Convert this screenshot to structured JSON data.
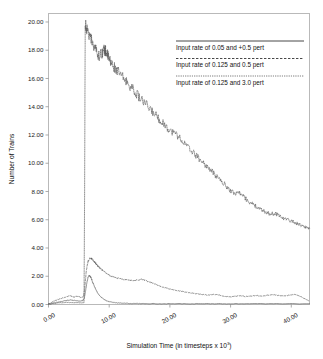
{
  "chart_data": {
    "type": "line",
    "title": "",
    "xlabel": "Simulation Time (in timesteps x 10",
    "xlabel_sup": "3",
    "xlabel_tail": ")",
    "ylabel": "Number of Trains",
    "xlim": [
      0,
      43
    ],
    "ylim": [
      0,
      20.6
    ],
    "grid": false,
    "legend_position": "upper-right",
    "xticks": [
      "0.00",
      "10.00",
      "20.00",
      "30.00",
      "40.00"
    ],
    "xtick_values": [
      0,
      10,
      20,
      30,
      40
    ],
    "yticks": [
      "0.00",
      "2.00",
      "4.00",
      "6.00",
      "8.00",
      "10.00",
      "12.00",
      "14.00",
      "16.00",
      "18.00",
      "20.00"
    ],
    "ytick_values": [
      0,
      2,
      4,
      6,
      8,
      10,
      12,
      14,
      16,
      18,
      20
    ],
    "series": [
      {
        "name": "Input rate of 0.05 and +0.5 pert",
        "style": "solid",
        "color": "#555555",
        "x": [
          0.0,
          0.7,
          1.4,
          2.1,
          2.8,
          3.2,
          3.6,
          4.0,
          4.4,
          4.8,
          5.2,
          5.6,
          5.9,
          6.1,
          6.3,
          6.5,
          6.7,
          6.9,
          7.1,
          7.3,
          7.6,
          7.9,
          8.2,
          8.6,
          9.0,
          9.5,
          10.0,
          10.6,
          11.2,
          12.0,
          13.0,
          14.0,
          15.0,
          17.0,
          19.0,
          21.0,
          24.0,
          27.0,
          30.0,
          34.0,
          38.0,
          43.0
        ],
        "y": [
          0.02,
          0.1,
          0.16,
          0.22,
          0.28,
          0.3,
          0.33,
          0.3,
          0.28,
          0.26,
          0.24,
          0.26,
          0.45,
          0.95,
          1.5,
          1.9,
          2.05,
          1.98,
          1.8,
          1.55,
          1.25,
          0.98,
          0.75,
          0.55,
          0.4,
          0.28,
          0.2,
          0.15,
          0.12,
          0.1,
          0.08,
          0.07,
          0.06,
          0.06,
          0.05,
          0.05,
          0.05,
          0.05,
          0.05,
          0.05,
          0.05,
          0.05
        ]
      },
      {
        "name": "Input rate of 0.125 and 0.5 pert",
        "style": "dashed",
        "color": "#555555",
        "x": [
          0.0,
          0.6,
          1.2,
          1.8,
          2.4,
          3.0,
          3.4,
          3.8,
          4.2,
          4.6,
          5.0,
          5.4,
          5.8,
          6.0,
          6.2,
          6.5,
          6.8,
          7.1,
          7.4,
          7.7,
          8.0,
          8.4,
          8.8,
          9.3,
          9.8,
          10.3,
          10.9,
          11.5,
          12.1,
          12.7,
          13.3,
          14.0,
          14.7,
          15.3,
          15.9,
          16.5,
          17.2,
          17.9,
          18.6,
          19.4,
          20.2,
          21.0,
          21.8,
          22.6,
          23.5,
          24.4,
          25.3,
          26.2,
          27.1,
          28.0,
          28.9,
          29.8,
          30.7,
          31.6,
          32.5,
          33.4,
          34.3,
          35.2,
          36.1,
          37.0,
          37.9,
          38.8,
          39.7,
          40.5,
          41.2,
          41.8,
          42.4,
          43.0
        ],
        "y": [
          0.03,
          0.18,
          0.3,
          0.38,
          0.48,
          0.55,
          0.62,
          0.58,
          0.52,
          0.6,
          0.55,
          0.5,
          0.58,
          1.3,
          2.3,
          3.05,
          3.3,
          3.25,
          3.1,
          2.95,
          2.8,
          2.62,
          2.45,
          2.3,
          2.15,
          2.02,
          1.92,
          1.86,
          1.8,
          1.76,
          1.72,
          1.7,
          1.74,
          1.78,
          1.72,
          1.62,
          1.5,
          1.38,
          1.26,
          1.16,
          1.08,
          1.0,
          0.94,
          0.88,
          0.82,
          0.76,
          0.72,
          0.66,
          0.72,
          0.68,
          0.58,
          0.54,
          0.58,
          0.62,
          0.56,
          0.6,
          0.64,
          0.58,
          0.66,
          0.7,
          0.64,
          0.6,
          0.66,
          0.72,
          0.62,
          0.5,
          0.36,
          0.24
        ]
      },
      {
        "name": "Input rate of 0.125 and 3.0 pert",
        "style": "dotted",
        "color": "#555555",
        "x": [
          0.0,
          1.0,
          2.0,
          3.0,
          4.0,
          5.0,
          5.6,
          5.85,
          5.95,
          6.05,
          6.3,
          6.8,
          7.3,
          7.8,
          8.3,
          8.8,
          9.1,
          9.4,
          9.7,
          10.0,
          10.4,
          11.0,
          11.6,
          12.3,
          13.0,
          13.8,
          14.6,
          15.4,
          16.2,
          17.0,
          17.8,
          18.6,
          19.4,
          20.2,
          21.0,
          21.8,
          22.6,
          23.4,
          24.2,
          25.0,
          25.8,
          26.6,
          27.4,
          28.2,
          29.0,
          29.8,
          30.6,
          31.4,
          32.0,
          32.6,
          33.4,
          34.2,
          35.0,
          35.8,
          36.6,
          37.4,
          38.2,
          39.0,
          39.8,
          40.6,
          41.4,
          42.2,
          43.0
        ],
        "y": [
          0.02,
          0.08,
          0.12,
          0.15,
          0.14,
          0.13,
          0.12,
          0.12,
          8.0,
          19.8,
          19.55,
          19.0,
          18.5,
          18.05,
          17.6,
          17.8,
          18.05,
          17.95,
          17.7,
          17.35,
          17.05,
          16.7,
          16.4,
          16.05,
          15.7,
          15.3,
          14.85,
          14.45,
          14.1,
          13.7,
          13.35,
          12.95,
          12.6,
          12.25,
          12.1,
          11.7,
          11.3,
          10.95,
          10.6,
          10.25,
          9.9,
          9.55,
          9.2,
          8.85,
          8.5,
          8.15,
          7.85,
          7.95,
          7.7,
          7.45,
          7.15,
          6.95,
          6.7,
          6.55,
          6.4,
          6.45,
          6.25,
          6.05,
          5.95,
          5.8,
          5.65,
          5.5,
          5.4
        ]
      }
    ],
    "legend": [
      {
        "label": "Input rate of 0.05 and +0.5 pert",
        "style": "solid"
      },
      {
        "label": "Input rate of 0.125 and 0.5 pert",
        "style": "dashed"
      },
      {
        "label": "Input rate of 0.125 and 3.0 pert",
        "style": "dotted"
      }
    ]
  }
}
